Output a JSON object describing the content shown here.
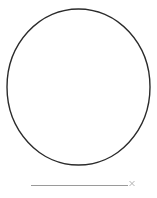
{
  "canvas": {
    "width": 157,
    "height": 198,
    "background_color": "#ffffff",
    "label": "drawing-canvas"
  },
  "shapes": {
    "circle": {
      "name": "circle-outline",
      "center_x": 78.5,
      "center_y": 87,
      "radius_x": 71.5,
      "radius_y": 78,
      "stroke_color": "#2b2b2b",
      "stroke_width": 1.4,
      "fill": "none"
    },
    "baseline": {
      "name": "horizontal-line",
      "x1": 31,
      "y1": 185.5,
      "x2": 128,
      "y2": 185.5,
      "stroke_color": "#9a9a9a",
      "stroke_width": 1.2
    },
    "cross": {
      "name": "x-mark",
      "center_x": 132,
      "center_y": 183.5,
      "size": 5,
      "stroke_color": "#a8a8a8",
      "stroke_width": 0.9,
      "glyph": "x"
    }
  }
}
